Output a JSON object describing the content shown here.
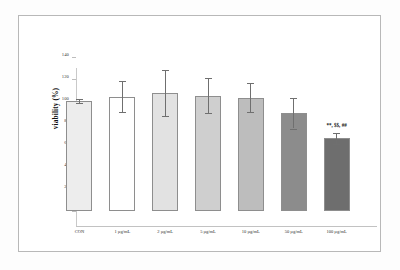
{
  "chart_data": {
    "type": "bar",
    "title": "",
    "xlabel": "",
    "ylabel": "viability (%)",
    "ylim": [
      0,
      140
    ],
    "ytick_step": 20,
    "yticks": [
      "0",
      "20",
      "40",
      "60",
      "80",
      "100",
      "120",
      "140"
    ],
    "grid": false,
    "legend": "none",
    "categories": [
      "CON",
      "1 µg/mL",
      "2 µg/mL",
      "5 µg/mL",
      "10 µg/mL",
      "50 µg/mL",
      "100 µg/mL"
    ],
    "values": [
      100,
      104,
      107,
      105,
      103,
      89,
      66
    ],
    "errors": [
      2,
      14,
      21,
      16,
      13,
      14,
      5
    ],
    "bar_colors": [
      "#ededed",
      "#ffffff",
      "#e2e2e2",
      "#cfcfcf",
      "#bdbdbd",
      "#8c8c8c",
      "#6e6e6e"
    ],
    "bar_border_color": "#8e8e8e",
    "error_bar_color": "#6f6f6f",
    "annotations": [
      {
        "text": "**, $$, ##",
        "category": "100 µg/mL",
        "value": 76
      }
    ]
  },
  "figure": {
    "background_color": "#ffffff",
    "frame_color": "#b8b8b8",
    "axis_color": "#c2c2c2"
  }
}
